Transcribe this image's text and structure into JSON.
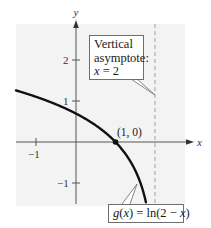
{
  "chart_data": {
    "type": "line",
    "title": "",
    "xlabel": "x",
    "ylabel": "y",
    "xlim": [
      -1.5,
      2.8
    ],
    "ylim": [
      -1.5,
      2.9
    ],
    "x_ticks": [
      {
        "value": -1,
        "label": "-1"
      }
    ],
    "y_ticks": [
      {
        "value": 2,
        "label": "2"
      },
      {
        "value": 1,
        "label": "1"
      },
      {
        "value": -1,
        "label": "-1"
      }
    ],
    "grid": false,
    "series": [
      {
        "name": "g(x) = ln(2 - x)",
        "function": "ln(2 - x)",
        "x": [
          -1.5,
          -1,
          -0.5,
          0,
          0.5,
          1,
          1.5,
          1.8,
          1.9,
          1.95,
          1.97
        ],
        "y": [
          1.253,
          1.099,
          0.916,
          0.693,
          0.405,
          0,
          -0.693,
          -1.609,
          -2.303,
          -2.996,
          -3.507
        ],
        "color": "#111111"
      }
    ],
    "points": [
      {
        "x": 1,
        "y": 0,
        "label": "(1, 0)"
      }
    ],
    "asymptotes": [
      {
        "type": "vertical",
        "x": 2,
        "style": "dashed"
      }
    ],
    "annotations": [
      {
        "text": "Vertical asymptote: x = 2",
        "target": "asymptote x=2"
      },
      {
        "text": "g(x) = ln(2 - x)",
        "target": "curve"
      }
    ]
  },
  "axes": {
    "x_label": "x",
    "y_label": "y",
    "tick_labels": {
      "x_neg1": "−1",
      "y_2": "2",
      "y_1": "1",
      "y_neg1": "−1"
    }
  },
  "point_label": "(1, 0)",
  "asymptote_callout": {
    "line1": "Vertical",
    "line2": "asymptote:",
    "line3_var": "x",
    "line3_rest": " = 2"
  },
  "function_callout": {
    "g": "g",
    "x1": "x",
    "mid": ") = ln(2 − ",
    "x2": "x",
    "open": "(",
    "close": ")"
  },
  "colors": {
    "plot_bg": "#f3f3f3",
    "axis": "#555555",
    "curve": "#111111",
    "asymptote": "#9a9a9a"
  }
}
